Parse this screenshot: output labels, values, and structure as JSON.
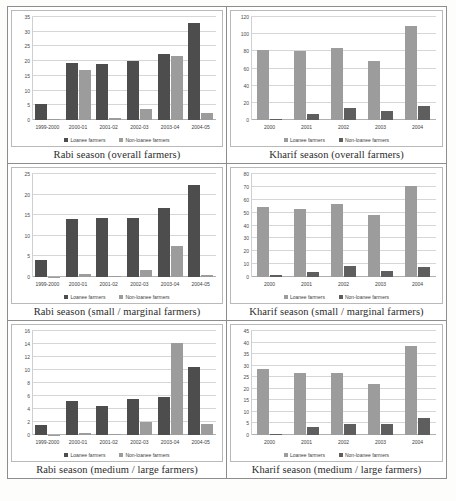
{
  "figure": {
    "series_names": [
      "Loanee farmers",
      "Non-loanee farmers"
    ],
    "colors": {
      "dark": "#4d4d4d",
      "light": "#9c9c9c"
    }
  },
  "charts": [
    {
      "caption": "Rabi season (overall farmers)",
      "chart_data": {
        "type": "bar",
        "title": "Rabi season (overall farmers)",
        "categories": [
          "1999-2000",
          "2000-01",
          "2001-02",
          "2002-03",
          "2003-04",
          "2004-05"
        ],
        "series": [
          {
            "name": "Loanee farmers",
            "values": [
              5.3,
              19.5,
              19.2,
              20.0,
              22.5,
              33.0
            ]
          },
          {
            "name": "Non-loanee farmers",
            "values": [
              0.2,
              17.0,
              0.8,
              3.7,
              21.8,
              2.5
            ]
          }
        ],
        "yticks": [
          0,
          5,
          10,
          15,
          20,
          25,
          30,
          35
        ],
        "ylim": [
          0,
          35
        ],
        "xlabel": "",
        "ylabel": "",
        "grid": true,
        "legend": "bottom",
        "series_order": "dark-first"
      }
    },
    {
      "caption": "Kharif season (overall farmers)",
      "chart_data": {
        "type": "bar",
        "title": "Kharif season (overall farmers)",
        "categories": [
          "2000",
          "2001",
          "2002",
          "2003",
          "2004"
        ],
        "series": [
          {
            "name": "Loanee farmers",
            "values": [
              82,
              80,
              84,
              69,
              110
            ]
          },
          {
            "name": "Non-loanee farmers",
            "values": [
              1.5,
              7,
              14,
              10,
              16
            ]
          }
        ],
        "yticks": [
          0,
          20,
          40,
          60,
          80,
          100,
          120
        ],
        "ylim": [
          0,
          120
        ],
        "xlabel": "",
        "ylabel": "",
        "grid": true,
        "legend": "bottom",
        "series_order": "light-first"
      }
    },
    {
      "caption": "Rabi season (small / marginal farmers)",
      "chart_data": {
        "type": "bar",
        "title": "Rabi season (small / marginal farmers)",
        "categories": [
          "1999-2000",
          "2000-01",
          "2001-02",
          "2002-03",
          "2003-04",
          "2004-05"
        ],
        "series": [
          {
            "name": "Loanee farmers",
            "values": [
              4.2,
              14.0,
              14.3,
              14.3,
              16.8,
              22.3
            ]
          },
          {
            "name": "Non-loanee farmers",
            "values": [
              0.05,
              0.7,
              0.2,
              1.7,
              7.5,
              0.4
            ]
          }
        ],
        "yticks": [
          0,
          5,
          10,
          15,
          20,
          25
        ],
        "ylim": [
          0,
          25
        ],
        "xlabel": "",
        "ylabel": "",
        "grid": true,
        "legend": "bottom",
        "series_order": "dark-first"
      }
    },
    {
      "caption": "Kharif season (small / marginal farmers)",
      "chart_data": {
        "type": "bar",
        "title": "Kharif season (small / marginal farmers)",
        "categories": [
          "2000",
          "2001",
          "2002",
          "2003",
          "2004"
        ],
        "series": [
          {
            "name": "Loanee farmers",
            "values": [
              54,
              53,
              57,
              48,
              71
            ]
          },
          {
            "name": "Non-loanee farmers",
            "values": [
              1.5,
              4,
              8.5,
              4.5,
              8
            ]
          }
        ],
        "yticks": [
          0,
          10,
          20,
          30,
          40,
          50,
          60,
          70,
          80
        ],
        "ylim": [
          0,
          80
        ],
        "xlabel": "",
        "ylabel": "",
        "grid": true,
        "legend": "bottom",
        "series_order": "light-first"
      }
    },
    {
      "caption": "Rabi season (medium / large farmers)",
      "chart_data": {
        "type": "bar",
        "title": "Rabi season (medium / large farmers)",
        "categories": [
          "1999-2000",
          "2000-01",
          "2001-02",
          "2002-03",
          "2003-04",
          "2004-05"
        ],
        "series": [
          {
            "name": "Loanee farmers",
            "values": [
              1.6,
              5.3,
              4.5,
              5.5,
              5.9,
              10.4
            ]
          },
          {
            "name": "Non-loanee farmers",
            "values": [
              0.05,
              0.25,
              0.1,
              2.0,
              14.1,
              1.7
            ]
          }
        ],
        "yticks": [
          0,
          2,
          4,
          6,
          8,
          10,
          12,
          14,
          16
        ],
        "ylim": [
          0,
          16
        ],
        "xlabel": "",
        "ylabel": "",
        "grid": true,
        "legend": "bottom",
        "series_order": "dark-first"
      }
    },
    {
      "caption": "Kharif season (medium / large farmers)",
      "chart_data": {
        "type": "bar",
        "title": "Kharif season (medium / large farmers)",
        "categories": [
          "2000",
          "2001",
          "2002",
          "2003",
          "2004"
        ],
        "series": [
          {
            "name": "Loanee farmers",
            "values": [
              28.5,
              26.8,
              27.0,
              22.0,
              38.5
            ]
          },
          {
            "name": "Non-loanee farmers",
            "values": [
              0.5,
              3.5,
              4.7,
              4.8,
              7.2
            ]
          }
        ],
        "yticks": [
          0,
          5,
          10,
          15,
          20,
          25,
          30,
          35,
          40,
          45
        ],
        "ylim": [
          0,
          45
        ],
        "xlabel": "",
        "ylabel": "",
        "grid": true,
        "legend": "bottom",
        "series_order": "light-first"
      }
    }
  ]
}
